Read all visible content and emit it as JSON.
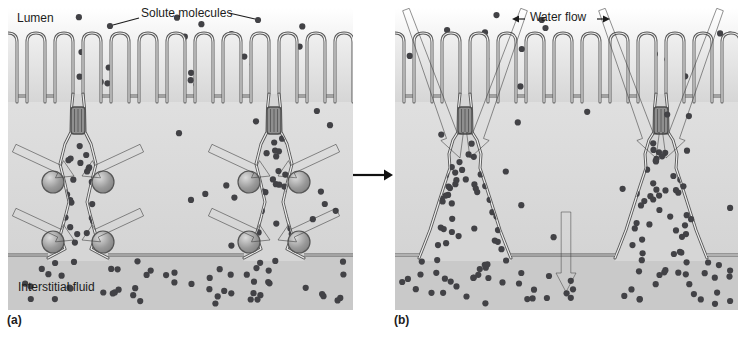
{
  "labels": {
    "lumen": "Lumen",
    "solute": "Solute molecules",
    "water": "Water flow",
    "interstitial": "Interstitial fluid",
    "caption_a": "(a)",
    "caption_b": "(b)"
  },
  "colors": {
    "page_bg": "#ffffff",
    "lumen_top": "#ffffff",
    "lumen_bottom": "#dcdcdc",
    "cell_top": "#e0e0e0",
    "cell_bottom": "#d4d4d4",
    "space_fill": "#d6d6d6",
    "interstitial": "#c9c9c9",
    "membrane": "#585858",
    "membrane_inner": "#ededed",
    "villus_top": "#f0f0f0",
    "villus_bottom": "#d6d6d6",
    "junction_fill": "#8f8f8f",
    "junction_stroke": "#4d4d4d",
    "junction_stripe": "#5e5e5e",
    "sphere_light": "#dcdcdc",
    "sphere_mid": "#9a9a9a",
    "sphere_dark": "#7f7f7f",
    "sphere_stroke": "#565656",
    "pump_arrow_light": "#b6b6b6",
    "pump_arrow_dark": "#2d2d2d",
    "water_arrow_light": "#bdbdbd",
    "water_arrow_dark": "#2f2f2f",
    "down_arrow_light": "#d0d0d0",
    "down_arrow_dark": "#8d8d8d",
    "leader": "#1c1c1c",
    "mid_arrow": "#111111",
    "label_text": "#1c1c1c"
  },
  "figure": {
    "panel_a": {
      "channels": 2,
      "pump_arrows_per_channel": 4,
      "spheres_per_channel": 4
    },
    "panel_b": {
      "channels": 2,
      "water_arrows_per_channel": 2,
      "transcellular_down_arrows": 1
    }
  },
  "dots": {
    "seed": 9,
    "radius": 3.1,
    "color": "#424246",
    "panel_a": [
      {
        "name": "lumen",
        "type": "rect",
        "x0": 6,
        "y0": 4,
        "x1": 336,
        "y1": 80,
        "count": 24,
        "under": true
      },
      {
        "name": "cells",
        "type": "rect",
        "x0": 8,
        "y0": 100,
        "x1": 336,
        "y1": 240,
        "count": 15
      },
      {
        "name": "channel-1",
        "type": "funnel",
        "cx": 70,
        "y0": 130,
        "y1": 246,
        "w0": 18,
        "w1": 52,
        "count": 26,
        "channel": 0
      },
      {
        "name": "channel-2",
        "type": "funnel",
        "cx": 266,
        "y0": 130,
        "y1": 246,
        "w0": 18,
        "w1": 52,
        "count": 26,
        "channel": 1
      },
      {
        "name": "interstitial",
        "type": "rect",
        "x0": 6,
        "y0": 252,
        "x1": 338,
        "y1": 296,
        "count": 54
      }
    ],
    "panel_b": [
      {
        "name": "lumen",
        "type": "rect",
        "x0": 6,
        "y0": 4,
        "x1": 336,
        "y1": 80,
        "count": 30,
        "under": true
      },
      {
        "name": "cells",
        "type": "rect",
        "x0": 8,
        "y0": 100,
        "x1": 336,
        "y1": 236,
        "count": 13
      },
      {
        "name": "funnel-1",
        "type": "funnel",
        "cx": 70,
        "y0": 130,
        "y1": 246,
        "w0": 18,
        "w1": 86,
        "count": 38,
        "channel": 0
      },
      {
        "name": "funnel-2",
        "type": "funnel",
        "cx": 266,
        "y0": 130,
        "y1": 246,
        "w0": 18,
        "w1": 86,
        "count": 38,
        "channel": 1
      },
      {
        "name": "interstitial",
        "type": "rect",
        "x0": 6,
        "y0": 252,
        "x1": 336,
        "y1": 296,
        "count": 60
      }
    ]
  }
}
